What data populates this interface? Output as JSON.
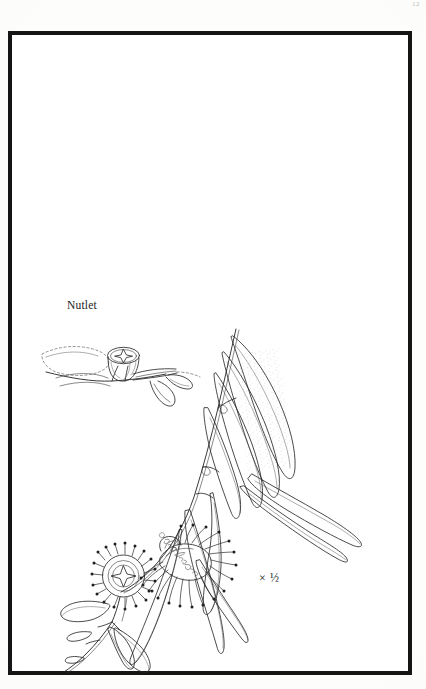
{
  "plate": {
    "kind": "botanical-illustration-plate",
    "page_number": "12",
    "background_color": "#fdfdfc",
    "ink_color": "#1b1b1b",
    "frame": {
      "border_color": "#151515",
      "border_width_px": 4.5,
      "x": 8,
      "y": 31,
      "width": 404,
      "height": 644
    }
  },
  "labels": {
    "nutlet": "Nutlet",
    "scale": "× ½"
  },
  "signature": {
    "text": "signature",
    "description": "cursive artist signature inked diagonally along the branch stem"
  },
  "figures": [
    {
      "id": "nutlet-detail",
      "name": "nutlet-detail-drawing",
      "label": "Nutlet",
      "description": "Cup-shaped gumnut capsule with four-pointed star valve pattern, seated on a short branch bearing small leaves",
      "x": 38,
      "y": 330,
      "width": 155,
      "height": 88
    },
    {
      "id": "flowering-branch",
      "name": "flowering-branch-drawing",
      "label": "",
      "description": "Branch of eucalyptus with long sickle-shaped adult leaves, dense stamen flowers, woody capsules and small juvenile leaves",
      "x": 40,
      "y": 325,
      "width": 330,
      "height": 350
    }
  ],
  "details": {
    "leaf_count_approx": 11,
    "flower_count": 2,
    "capsule_count": 2,
    "leaf_shape": "lanceolate-falcate",
    "stipple_marking": "oil gland stippling along midrib"
  }
}
